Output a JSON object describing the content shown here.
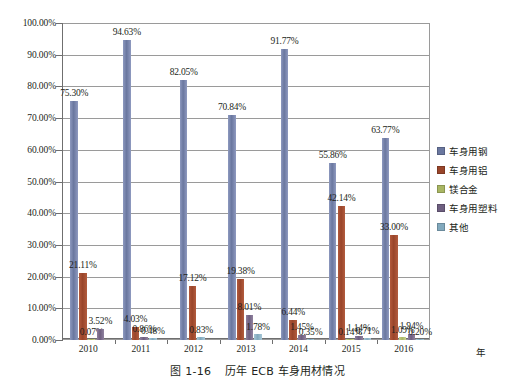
{
  "caption": {
    "prefix": "图",
    "number": "1-16",
    "title": "历年 ECB 车身用材情况"
  },
  "axis": {
    "x_unit_label": "年"
  },
  "legend": {
    "position": "right",
    "items": [
      {
        "label": "车身用钢",
        "color": "#6a779f"
      },
      {
        "label": "车身用铝",
        "color": "#99452a"
      },
      {
        "label": "镁合金",
        "color": "#a9b663"
      },
      {
        "label": "车身用塑料",
        "color": "#6e5f80"
      },
      {
        "label": "其他",
        "color": "#82a9bd"
      }
    ]
  },
  "chart_data": {
    "type": "bar",
    "title": "历年 ECB 车身用材情况",
    "xlabel": "年",
    "ylabel": "",
    "ylim": [
      0,
      100
    ],
    "ytick_step": 10,
    "ytick_labels": [
      "0.00%",
      "10.00%",
      "20.00%",
      "30.00%",
      "40.00%",
      "50.00%",
      "60.00%",
      "70.00%",
      "80.00%",
      "90.00%",
      "100.00%"
    ],
    "grid": true,
    "categories": [
      "2010",
      "2011",
      "2012",
      "2013",
      "2014",
      "2015",
      "2016"
    ],
    "series": [
      {
        "name": "车身用钢",
        "color": "#6a779f",
        "values": [
          75.3,
          94.63,
          82.05,
          70.84,
          91.77,
          55.86,
          63.77
        ],
        "labels": [
          "75.30%",
          "94.63%",
          "82.05%",
          "70.84%",
          "91.77%",
          "55.86%",
          "63.77%"
        ]
      },
      {
        "name": "车身用铝",
        "color": "#99452a",
        "values": [
          21.11,
          4.03,
          17.12,
          19.38,
          6.44,
          42.14,
          33.0
        ],
        "labels": [
          "21.11%",
          "4.03%",
          "17.12%",
          "19.38%",
          "6.44%",
          "42.14%",
          "33.00%"
        ]
      },
      {
        "name": "镁合金",
        "color": "#a9b663",
        "values": [
          0.07,
          null,
          null,
          null,
          null,
          0.14,
          1.09
        ],
        "labels": [
          "0.07%",
          "",
          "",
          "",
          "",
          "0.14%",
          "1.09%"
        ]
      },
      {
        "name": "车身用塑料",
        "color": "#6e5f80",
        "values": [
          3.52,
          0.86,
          null,
          8.01,
          1.45,
          1.14,
          1.94
        ],
        "labels": [
          "3.52%",
          "0.86%",
          "",
          "8.01%",
          "1.45%",
          "1.14%",
          "1.94%"
        ]
      },
      {
        "name": "其他",
        "color": "#82a9bd",
        "values": [
          null,
          0.48,
          0.83,
          1.78,
          0.35,
          0.71,
          0.2
        ],
        "labels": [
          "",
          "0.48%",
          "0.83%",
          "1.78%",
          "0.35%",
          "0.71%",
          "0.20%"
        ]
      }
    ]
  }
}
